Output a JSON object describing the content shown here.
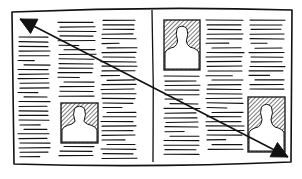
{
  "diagram": {
    "colors": {
      "ink": "#111111",
      "paper": "#ffffff",
      "hatch": "#222222"
    },
    "page": {
      "x1": 12,
      "y1": 8,
      "x2": 292,
      "y2": 166
    },
    "divider": {
      "x": 152,
      "y1": 10,
      "y2": 162
    },
    "columns": [
      {
        "id": "left-col-1",
        "x": 18,
        "w": 32,
        "y_start": 37,
        "y_end": 160
      },
      {
        "id": "left-col-2",
        "x": 58,
        "w": 38,
        "y_start": 22,
        "y_end": 158
      },
      {
        "id": "left-col-3",
        "x": 101,
        "w": 36,
        "y_start": 20,
        "y_end": 158
      },
      {
        "id": "right-col-1",
        "x": 164,
        "w": 36,
        "y_start": 76,
        "y_end": 155
      },
      {
        "id": "right-col-2",
        "x": 206,
        "w": 38,
        "y_start": 20,
        "y_end": 152
      },
      {
        "id": "right-col-3",
        "x": 249,
        "w": 36,
        "y_start": 20,
        "y_end": 92
      }
    ],
    "photos": [
      {
        "id": "photo-left-bottom",
        "x": 61,
        "y": 103,
        "w": 37,
        "h": 40
      },
      {
        "id": "photo-right-top",
        "x": 164,
        "y": 20,
        "w": 36,
        "h": 50
      },
      {
        "id": "photo-right-bottom",
        "x": 248,
        "y": 97,
        "w": 37,
        "h": 55
      }
    ],
    "arrow": {
      "label": "reading-direction",
      "from": {
        "x": 20,
        "y": 19
      },
      "to": {
        "x": 288,
        "y": 157
      },
      "head_at_start": true,
      "head_at_end": true
    }
  }
}
